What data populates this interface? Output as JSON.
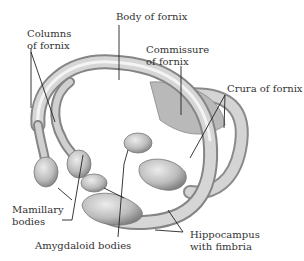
{
  "figure": {
    "colors": {
      "structure": "#c9c9c9",
      "shade": "#8a8a8a",
      "highlight": "#f2f2f2",
      "line": "#222222",
      "text": "#333333"
    }
  },
  "labels": {
    "columns": [
      "Columns",
      "of fornix"
    ],
    "body": "Body of fornix",
    "commissure": [
      "Commissure",
      "of fornix"
    ],
    "crura": "Crura of fornix",
    "mamillary": [
      "Mamillary",
      "bodies"
    ],
    "amygdaloid": "Amygdaloid bodies",
    "hippocampus": [
      "Hippocampus",
      "with fimbria"
    ]
  }
}
